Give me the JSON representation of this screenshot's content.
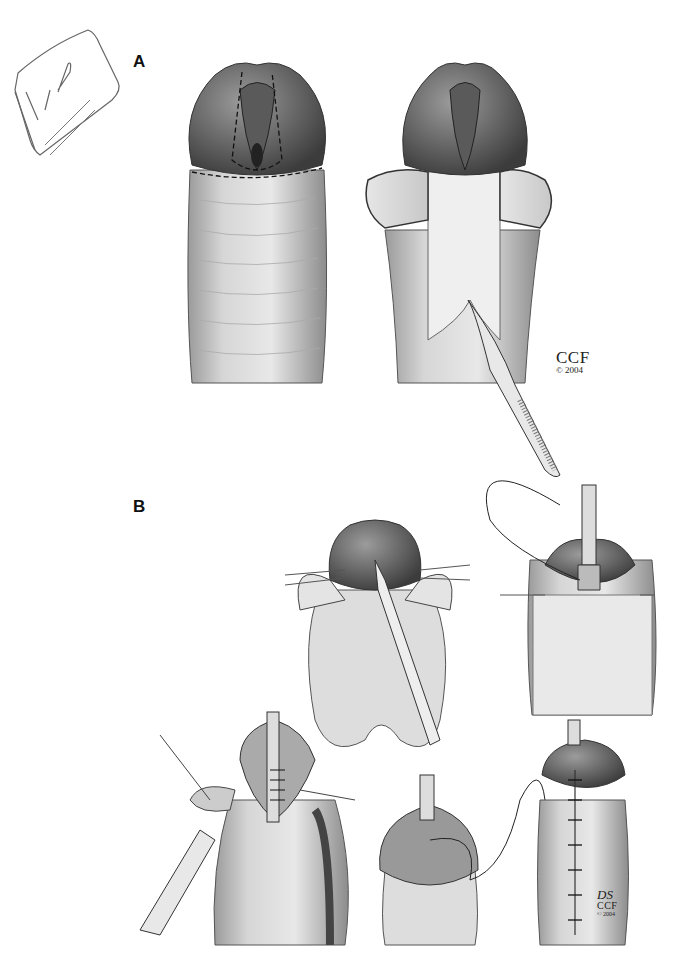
{
  "note": {
    "text": "TIP"
  },
  "panels": [
    {
      "label": "A"
    },
    {
      "label": "B"
    }
  ],
  "credits": [
    {
      "org": "CCF",
      "copyright": "© 2004"
    },
    {
      "signature": "DS",
      "org": "CCF",
      "copyright": "© 2004"
    }
  ],
  "colors": {
    "skin": "#d9d9d9",
    "shade": "#8a8a8a",
    "dark": "#4a4a4a",
    "line": "#222222"
  }
}
